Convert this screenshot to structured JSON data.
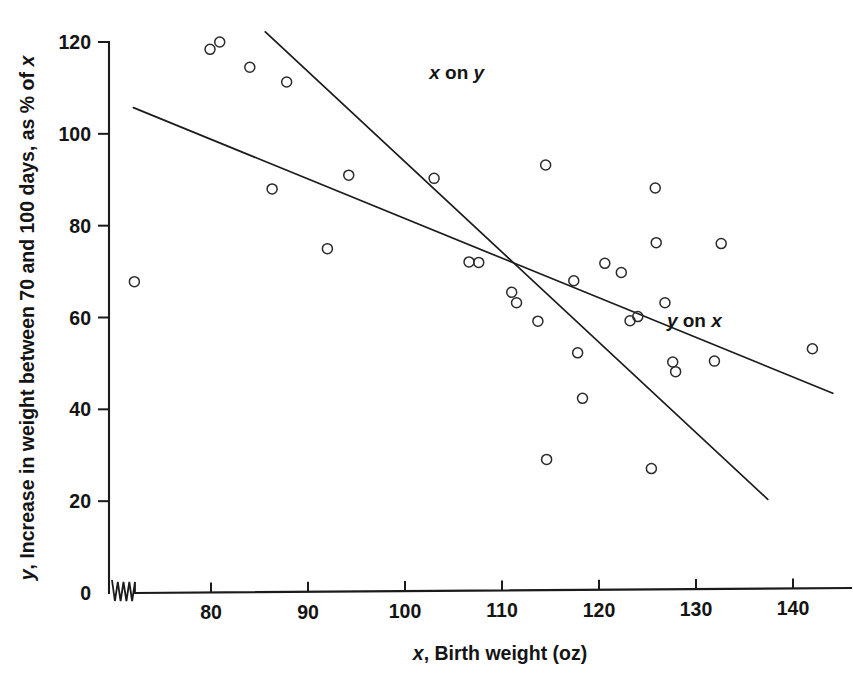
{
  "chart_data": {
    "type": "scatter",
    "title": "",
    "xlabel": "x, Birth weight (oz)",
    "xlabel_italic_part": "x",
    "xlabel_rest": ", Birth weight (oz)",
    "ylabel": "y, Increase in weight between 70 and 100 days, as % of x",
    "ylabel_italic_lead": "y",
    "ylabel_rest": ", Increase in weight between 70 and 100 days, as % of ",
    "ylabel_italic_tail": "x",
    "xlim": [
      71,
      144
    ],
    "ylim": [
      0,
      120
    ],
    "xticks": [
      80,
      90,
      100,
      110,
      120,
      130,
      140
    ],
    "yticks": [
      0,
      20,
      40,
      60,
      80,
      100,
      120
    ],
    "xtick_labels": [
      "80",
      "90",
      "100",
      "110",
      "120",
      "130",
      "140"
    ],
    "ytick_labels": [
      "0",
      "20",
      "40",
      "60",
      "80",
      "100",
      "120"
    ],
    "grid": false,
    "axis_break_x": true,
    "marker": "open-circle",
    "legend_position": "inline-annotations",
    "points": [
      {
        "x": 72.1,
        "y": 67.8
      },
      {
        "x": 79.9,
        "y": 118.4
      },
      {
        "x": 80.9,
        "y": 120.0
      },
      {
        "x": 84.0,
        "y": 114.5
      },
      {
        "x": 86.3,
        "y": 88.0
      },
      {
        "x": 87.8,
        "y": 111.3
      },
      {
        "x": 92.0,
        "y": 75.0
      },
      {
        "x": 94.2,
        "y": 91.0
      },
      {
        "x": 103.0,
        "y": 90.3
      },
      {
        "x": 106.6,
        "y": 72.1
      },
      {
        "x": 107.6,
        "y": 72.0
      },
      {
        "x": 111.0,
        "y": 65.5
      },
      {
        "x": 111.5,
        "y": 63.2
      },
      {
        "x": 113.7,
        "y": 59.2
      },
      {
        "x": 114.5,
        "y": 93.2
      },
      {
        "x": 114.6,
        "y": 29.1
      },
      {
        "x": 117.4,
        "y": 68.0
      },
      {
        "x": 117.8,
        "y": 52.3
      },
      {
        "x": 118.3,
        "y": 42.4
      },
      {
        "x": 120.6,
        "y": 71.8
      },
      {
        "x": 122.3,
        "y": 69.8
      },
      {
        "x": 123.2,
        "y": 59.3
      },
      {
        "x": 124.0,
        "y": 60.2
      },
      {
        "x": 125.4,
        "y": 27.1
      },
      {
        "x": 125.8,
        "y": 88.2
      },
      {
        "x": 125.9,
        "y": 76.3
      },
      {
        "x": 126.8,
        "y": 63.2
      },
      {
        "x": 127.6,
        "y": 50.3
      },
      {
        "x": 127.9,
        "y": 48.2
      },
      {
        "x": 131.9,
        "y": 50.5
      },
      {
        "x": 132.6,
        "y": 76.1
      },
      {
        "x": 142.0,
        "y": 53.2
      }
    ],
    "lines": [
      {
        "name": "x on y",
        "label": "x on y",
        "label_italic_lead": "x",
        "label_rest": " on ",
        "label_italic_tail": "y",
        "x1": 85.6,
        "y1": 122.2,
        "x2": 137.4,
        "y2": 20.4,
        "label_x": 102.5,
        "label_y": 112.0
      },
      {
        "name": "y on x",
        "label": "y on x",
        "label_italic_lead": "y",
        "label_rest": " on ",
        "label_italic_tail": "x",
        "x1": 72.0,
        "y1": 105.7,
        "x2": 144.1,
        "y2": 43.5,
        "label_x": 127.0,
        "label_y": 58.0
      }
    ]
  },
  "figure": {
    "background_color": "#ffffff",
    "ink_color": "#1b1b1b",
    "marker_radius_px": 5
  }
}
